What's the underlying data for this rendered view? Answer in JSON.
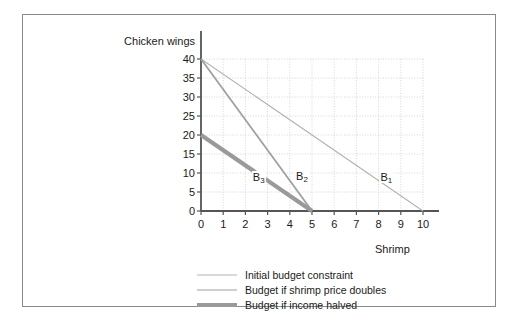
{
  "chart_data": {
    "type": "line",
    "title": "",
    "xlabel": "Shrimp",
    "ylabel": "Chicken wings",
    "xlim": [
      0,
      10
    ],
    "ylim": [
      0,
      40
    ],
    "xticks": [
      "0",
      "1",
      "2",
      "3",
      "4",
      "5",
      "6",
      "7",
      "8",
      "9",
      "10"
    ],
    "yticks": [
      "0",
      "5",
      "10",
      "15",
      "20",
      "25",
      "30",
      "35",
      "40"
    ],
    "grid": true,
    "legend_position": "below",
    "series": [
      {
        "name": "Initial budget constraint",
        "label": "B",
        "label_sub": "1",
        "color": "#b3b3b3",
        "width": 1.1,
        "points": [
          [
            0,
            40
          ],
          [
            10,
            0
          ]
        ],
        "label_x": 8.35,
        "label_y": 8.9
      },
      {
        "name": "Budget if shrimp price doubles",
        "label": "B",
        "label_sub": "2",
        "color": "#a0a0a0",
        "width": 1.8,
        "points": [
          [
            0,
            40
          ],
          [
            5,
            0
          ]
        ],
        "label_x": 4.55,
        "label_y": 9.3
      },
      {
        "name": "Budget if income halved",
        "label": "B",
        "label_sub": "3",
        "color": "#9a9a9a",
        "width": 4.2,
        "points": [
          [
            0,
            20
          ],
          [
            5,
            0
          ]
        ],
        "label_x": 2.6,
        "label_y": 9.0
      }
    ]
  },
  "colors": {
    "axis": "#555555",
    "grid": "#cccccc",
    "frame": "#8a8a8a",
    "text": "#1a1a1a",
    "background": "#ffffff"
  }
}
